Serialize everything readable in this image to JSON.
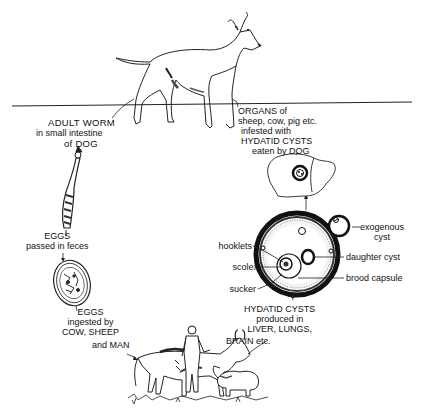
{
  "diagram": {
    "stages": [
      {
        "id": "adult-worm",
        "lines": [
          "ADULT WORM",
          "in small intestine",
          "of DOG"
        ]
      },
      {
        "id": "eggs-passed",
        "lines": [
          "EGGS",
          "passed in feces"
        ]
      },
      {
        "id": "eggs-ingested",
        "lines": [
          "EGGS",
          "ingested by",
          "COW, SHEEP",
          "and MAN"
        ]
      },
      {
        "id": "hydatid-cysts",
        "lines": [
          "HYDATID CYSTS",
          "produced in",
          "LIVER, LUNGS,",
          "BRAIN etc."
        ]
      },
      {
        "id": "organs-eaten",
        "lines": [
          "ORGANS of",
          "sheep, cow, pig etc.",
          "infested with",
          "HYDATID CYSTS",
          "eaten by DOG"
        ]
      }
    ],
    "cyst_parts": {
      "hooklets": "hooklets",
      "scolex": "scolex",
      "sucker": "sucker",
      "daughter_cyst": "daughter cyst",
      "brood_capsule": "brood capsule",
      "exogenous_cyst": [
        "exogenous",
        "cyst"
      ]
    },
    "illustrations": [
      "dog",
      "adult-worm",
      "egg",
      "cow",
      "man",
      "sheep",
      "liver-with-cyst",
      "hydatid-cyst",
      "exogenous-cyst"
    ]
  }
}
